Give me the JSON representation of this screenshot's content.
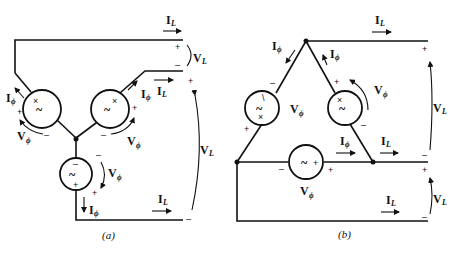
{
  "figure": {
    "panel_a": {
      "caption": "(a)",
      "connection": "wye",
      "labels": {
        "line_current": "I",
        "line_current_sub": "L",
        "phase_current": "I",
        "phase_current_sub": "ϕ",
        "line_voltage": "V",
        "line_voltage_sub": "L",
        "phase_voltage": "V",
        "phase_voltage_sub": "ϕ"
      },
      "signs": {
        "plus": "+",
        "minus": "–"
      },
      "source_glyph": "~"
    },
    "panel_b": {
      "caption": "(b)",
      "connection": "delta",
      "labels": {
        "line_current": "I",
        "line_current_sub": "L",
        "phase_current": "I",
        "phase_current_sub": "ϕ",
        "line_voltage": "V",
        "line_voltage_sub": "L",
        "phase_voltage": "V",
        "phase_voltage_sub": "ϕ"
      },
      "signs": {
        "plus": "+",
        "minus": "–"
      },
      "source_glyph": "~"
    }
  }
}
